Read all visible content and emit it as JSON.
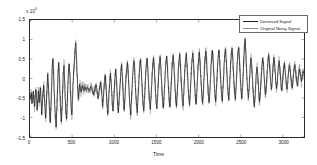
{
  "chart_data": {
    "type": "line",
    "title": "",
    "xlabel": "Time",
    "ylabel": "",
    "y_exponent_label": "x 10",
    "y_exponent_power": "4",
    "y_scale": 10000,
    "xlim": [
      0,
      3250
    ],
    "ylim": [
      -15000,
      15000
    ],
    "grid": false,
    "legend_position": "top-right",
    "xticks": [
      0,
      500,
      1000,
      1500,
      2000,
      2500,
      3000
    ],
    "xtick_labels": [
      "0",
      "500",
      "1000",
      "1500",
      "2000",
      "2500",
      "3000"
    ],
    "yticks": [
      -15000,
      -10000,
      -5000,
      0,
      5000,
      10000,
      15000
    ],
    "ytick_labels": [
      "-1.5",
      "-1",
      "-0.5",
      "0",
      "0.5",
      "1",
      "1.5"
    ],
    "series": [
      {
        "name": "Denoised Signal",
        "color": "#1c1c1c",
        "width": 0.9,
        "values": [
          -4200,
          -5100,
          -3600,
          -6400,
          -4800,
          -3200,
          -5600,
          -7200,
          -4400,
          -2800,
          -5200,
          -8100,
          -5400,
          -3100,
          -6200,
          -4100,
          -2400,
          -5800,
          -9400,
          -6100,
          -3400,
          -1800,
          -4600,
          -7800,
          -10200,
          -6400,
          -2600,
          1200,
          -1400,
          -5200,
          -8600,
          -11400,
          -7200,
          -2400,
          2800,
          5200,
          1400,
          -3600,
          -7400,
          -10800,
          -12400,
          -8200,
          -3400,
          1800,
          4200,
          600,
          -4400,
          -8800,
          -11200,
          -7400,
          -2800,
          1600,
          3400,
          -800,
          -5400,
          -9200,
          -10400,
          -6200,
          -1400,
          2400,
          3800,
          900,
          -3800,
          -7600,
          -9400,
          -5400,
          -900,
          2200,
          4600,
          7800,
          9200,
          5400,
          1200,
          -2600,
          -5400,
          -3200,
          -1400,
          -2200,
          -3400,
          -2600,
          -1800,
          -2400,
          -3100,
          -2800,
          -2200,
          -2600,
          -3000,
          -2700,
          -2300,
          -2500,
          -2900,
          -3200,
          -2600,
          -2100,
          -2400,
          -2800,
          -3400,
          -4200,
          -3600,
          -2800,
          -2200,
          -1600,
          -2400,
          -3800,
          -5200,
          -4400,
          -3000,
          -1800,
          -900,
          -2200,
          -4600,
          -7200,
          -5400,
          -2800,
          -600,
          900,
          -1400,
          -4200,
          -7400,
          -9200,
          -6400,
          -3200,
          -800,
          1400,
          -600,
          -3400,
          -6800,
          -8400,
          -5600,
          -2400,
          200,
          2400,
          400,
          -2800,
          -6200,
          -8800,
          -6400,
          -3400,
          -1200,
          1800,
          3600,
          1200,
          -2400,
          -5800,
          -8200,
          -5400,
          -2200,
          600,
          2800,
          4200,
          2000,
          -1400,
          -4800,
          -7400,
          -9400,
          -6200,
          -2800,
          800,
          3200,
          4600,
          2400,
          -1200,
          -4400,
          -7200,
          -8800,
          -5800,
          -2400,
          1200,
          3400,
          4800,
          2600,
          -800,
          -4000,
          -6800,
          -8400,
          -5400,
          -2000,
          1600,
          3800,
          5200,
          2800,
          -600,
          -3800,
          -6400,
          -8000,
          -5200,
          -1800,
          1800,
          4000,
          5400,
          3000,
          -400,
          -3600,
          -6200,
          -7800,
          -5000,
          -1600,
          2000,
          4200,
          5600,
          3200,
          -200,
          -3400,
          -6000,
          -7600,
          -4800,
          -1400,
          2200,
          4400,
          5800,
          3400,
          0,
          -3200,
          -5800,
          -7400,
          -4600,
          -1200,
          2400,
          4600,
          6000,
          3600,
          200,
          -3000,
          -5600,
          -7200,
          -4400,
          -1000,
          2600,
          4800,
          6200,
          3800,
          400,
          -2800,
          -5400,
          -7000,
          -4200,
          -800,
          2800,
          5000,
          6400,
          4000,
          600,
          -2600,
          -5200,
          -6800,
          -4000,
          -600,
          3000,
          5200,
          6600,
          4200,
          800,
          -2400,
          -5000,
          -6600,
          -3800,
          -400,
          3200,
          5400,
          6800,
          4400,
          1000,
          -2200,
          -4800,
          -6400,
          -3600,
          -200,
          3400,
          5600,
          7000,
          4600,
          1200,
          -2000,
          -4600,
          -6200,
          -3400,
          0,
          3600,
          5800,
          7200,
          4800,
          1400,
          -1800,
          -4400,
          -6000,
          -3200,
          200,
          3800,
          6000,
          7400,
          5000,
          1600,
          -1600,
          -4200,
          -5800,
          -3000,
          400,
          4000,
          6200,
          7600,
          5200,
          1800,
          -1400,
          -4000,
          -5600,
          -2800,
          600,
          4200,
          6400,
          7800,
          5400,
          2000,
          -1200,
          -3800,
          -5400,
          -2600,
          800,
          4400,
          6600,
          8000,
          5600,
          2200,
          -1000,
          -3600,
          -5200,
          -2400,
          1200,
          5200,
          8400,
          10200,
          6800,
          2800,
          -800,
          -3400,
          -5000,
          -2800,
          600,
          3400,
          5200,
          3400,
          400,
          -2600,
          -5400,
          -7200,
          -4800,
          -1800,
          1200,
          3000,
          1600,
          -1200,
          -3800,
          -6000,
          -4200,
          -1600,
          1400,
          3800,
          5400,
          3600,
          800,
          -2000,
          -4200,
          -2800,
          -400,
          2400,
          4800,
          6200,
          4400,
          1800,
          -800,
          -2800,
          -1400,
          1200,
          3600,
          5400,
          3800,
          1400,
          -1000,
          -2600,
          -1200,
          1400,
          3400,
          4600,
          2800,
          600,
          -1800,
          -3200,
          -1600,
          900,
          2800,
          4000,
          2400,
          400,
          -1600,
          -2800,
          -1400,
          1100,
          2600,
          3400,
          1800,
          200,
          -1400,
          -2400,
          -1000,
          1300,
          2800,
          3600,
          2000,
          600,
          -1000,
          -2000,
          -600,
          1400,
          2400,
          1600,
          400,
          -800,
          200,
          1200,
          1800,
          1400
        ]
      },
      {
        "name": "Original Noisy Signal",
        "color": "#8f8f8f",
        "width": 0.6,
        "noise_amplitude": 1400,
        "description": "Same underlying waveform as the denoised series plus additive high-frequency noise, drawn in light gray beneath the denoised trace."
      }
    ],
    "annotations": [
      {
        "text": "Large positive transient near x=150 reaching about 1.0e4"
      },
      {
        "text": "Second large transient near x=330 reaching about 0.95e4"
      },
      {
        "text": "Deep negative excursions near x=120-420 reaching about -1.25e4"
      },
      {
        "text": "Quasi-periodic oscillation with period about 120 samples from x=700 onward"
      },
      {
        "text": "Prominent peak near x=2400 reaching about 1.0e4"
      }
    ]
  },
  "axis": {
    "exponent_prefix": "x 10",
    "exponent_power": "4",
    "xlabel": "Time",
    "xtick_labels": [
      "0",
      "500",
      "1000",
      "1500",
      "2000",
      "2500",
      "3000"
    ],
    "ytick_labels": [
      "1.5",
      "1",
      "0.5",
      "0",
      "-0.5",
      "-1",
      "-1.5"
    ]
  },
  "legend": {
    "entries": [
      {
        "label": "Denoised Signal",
        "color": "#1c1c1c"
      },
      {
        "label": "Original Noisy Signal",
        "color": "#8f8f8f"
      }
    ]
  }
}
